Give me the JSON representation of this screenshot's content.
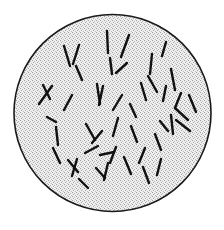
{
  "figure": {
    "kind": "microscopy-field-illustration",
    "caption": "",
    "background_color": "#ffffff"
  },
  "field_of_view": {
    "name": "circular-microscope-field",
    "shape": "circle",
    "center_x": 112.5,
    "center_y": 113,
    "radius": 98.5,
    "fill_color": "#e8e8e8",
    "stipple_dot_color": "#9a9a9a",
    "outline_color": "#1a1a1a",
    "outline_width": 1.6
  },
  "specimen": {
    "organism_type": "rod-shaped bacteria (bacilli)",
    "stain_color": "#111111",
    "rod_count": 46,
    "rod_width": 2.4,
    "rods": [
      {
        "x1": 64,
        "y1": 46,
        "x2": 70,
        "y2": 66
      },
      {
        "x1": 79,
        "y1": 45,
        "x2": 73,
        "y2": 64
      },
      {
        "x1": 76,
        "y1": 66,
        "x2": 82,
        "y2": 80
      },
      {
        "x1": 107,
        "y1": 31,
        "x2": 108,
        "y2": 53
      },
      {
        "x1": 110,
        "y1": 58,
        "x2": 112,
        "y2": 74
      },
      {
        "x1": 129,
        "y1": 35,
        "x2": 121,
        "y2": 57
      },
      {
        "x1": 116,
        "y1": 73,
        "x2": 127,
        "y2": 63
      },
      {
        "x1": 152,
        "y1": 54,
        "x2": 150,
        "y2": 74
      },
      {
        "x1": 166,
        "y1": 42,
        "x2": 162,
        "y2": 56
      },
      {
        "x1": 171,
        "y1": 69,
        "x2": 175,
        "y2": 90
      },
      {
        "x1": 43,
        "y1": 85,
        "x2": 50,
        "y2": 99
      },
      {
        "x1": 52,
        "y1": 86,
        "x2": 39,
        "y2": 104
      },
      {
        "x1": 72,
        "y1": 95,
        "x2": 64,
        "y2": 110
      },
      {
        "x1": 97,
        "y1": 84,
        "x2": 100,
        "y2": 104
      },
      {
        "x1": 103,
        "y1": 86,
        "x2": 99,
        "y2": 105
      },
      {
        "x1": 122,
        "y1": 95,
        "x2": 113,
        "y2": 110
      },
      {
        "x1": 141,
        "y1": 83,
        "x2": 146,
        "y2": 100
      },
      {
        "x1": 148,
        "y1": 76,
        "x2": 157,
        "y2": 92
      },
      {
        "x1": 166,
        "y1": 86,
        "x2": 163,
        "y2": 101
      },
      {
        "x1": 181,
        "y1": 93,
        "x2": 175,
        "y2": 108
      },
      {
        "x1": 189,
        "y1": 95,
        "x2": 196,
        "y2": 112
      },
      {
        "x1": 175,
        "y1": 108,
        "x2": 188,
        "y2": 120
      },
      {
        "x1": 176,
        "y1": 120,
        "x2": 190,
        "y2": 131
      },
      {
        "x1": 171,
        "y1": 115,
        "x2": 173,
        "y2": 134
      },
      {
        "x1": 160,
        "y1": 121,
        "x2": 168,
        "y2": 131
      },
      {
        "x1": 56,
        "y1": 127,
        "x2": 58,
        "y2": 145
      },
      {
        "x1": 53,
        "y1": 148,
        "x2": 60,
        "y2": 163
      },
      {
        "x1": 86,
        "y1": 124,
        "x2": 95,
        "y2": 140
      },
      {
        "x1": 92,
        "y1": 143,
        "x2": 102,
        "y2": 131
      },
      {
        "x1": 100,
        "y1": 155,
        "x2": 114,
        "y2": 152
      },
      {
        "x1": 118,
        "y1": 118,
        "x2": 113,
        "y2": 136
      },
      {
        "x1": 131,
        "y1": 126,
        "x2": 137,
        "y2": 142
      },
      {
        "x1": 145,
        "y1": 148,
        "x2": 139,
        "y2": 163
      },
      {
        "x1": 155,
        "y1": 134,
        "x2": 161,
        "y2": 150
      },
      {
        "x1": 116,
        "y1": 147,
        "x2": 110,
        "y2": 163
      },
      {
        "x1": 85,
        "y1": 153,
        "x2": 98,
        "y2": 146
      },
      {
        "x1": 68,
        "y1": 160,
        "x2": 78,
        "y2": 172
      },
      {
        "x1": 77,
        "y1": 159,
        "x2": 72,
        "y2": 176
      },
      {
        "x1": 96,
        "y1": 168,
        "x2": 105,
        "y2": 178
      },
      {
        "x1": 108,
        "y1": 163,
        "x2": 104,
        "y2": 180
      },
      {
        "x1": 124,
        "y1": 157,
        "x2": 131,
        "y2": 174
      },
      {
        "x1": 143,
        "y1": 167,
        "x2": 149,
        "y2": 183
      },
      {
        "x1": 161,
        "y1": 159,
        "x2": 157,
        "y2": 175
      },
      {
        "x1": 88,
        "y1": 188,
        "x2": 79,
        "y2": 179
      },
      {
        "x1": 47,
        "y1": 117,
        "x2": 56,
        "y2": 122
      },
      {
        "x1": 130,
        "y1": 104,
        "x2": 136,
        "y2": 117
      }
    ]
  }
}
